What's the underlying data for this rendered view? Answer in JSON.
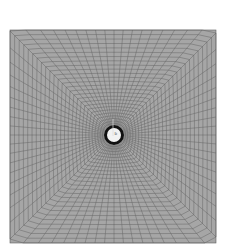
{
  "figure": {
    "type": "structured-mesh",
    "domain_box": {
      "x0": 10,
      "y0": 30,
      "x1": 216,
      "y1": 243
    },
    "fill_color": "#a6a6a6",
    "line_color": "#5e5e5e",
    "radial_lines": 72,
    "rings": 26,
    "cylinder": {
      "cx": 114,
      "cy": 135,
      "outer_r": 10,
      "inner_r": 7,
      "ring_color": "#111111",
      "fill_color": "#f2f2f2"
    },
    "cylinder_label": "b"
  }
}
